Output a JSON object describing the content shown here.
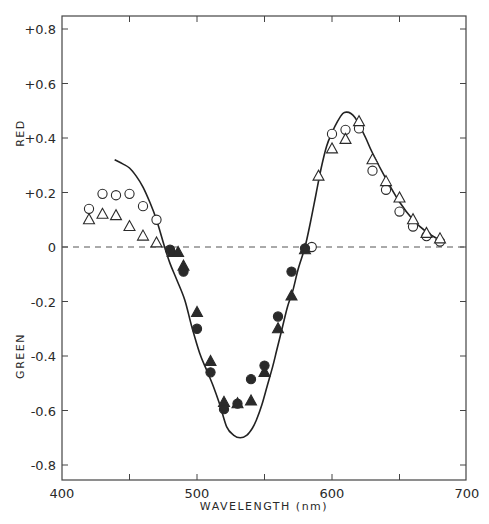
{
  "chart_data": {
    "type": "scatter",
    "title": "",
    "xlabel": "WAVELENGTH (nm)",
    "ylabel_top": "RED",
    "ylabel_bottom": "GREEN",
    "xlim": [
      400,
      700
    ],
    "ylim": [
      -0.85,
      0.85
    ],
    "x_ticks": [
      400,
      450,
      500,
      550,
      600,
      650,
      700
    ],
    "x_tick_labels": [
      "400",
      "500",
      "600",
      "700"
    ],
    "x_tick_label_values": [
      400,
      500,
      600,
      700
    ],
    "y_ticks": [
      0.8,
      0.6,
      0.4,
      0.2,
      0,
      -0.2,
      -0.4,
      -0.6,
      -0.8
    ],
    "y_tick_labels": [
      "+0.8",
      "+0.6",
      "+0.4",
      "+0.2",
      "0",
      "-0.2",
      "-0.4",
      "-0.6",
      "-0.8"
    ],
    "zero_line": "dashed",
    "grid": false,
    "legend": null,
    "series": [
      {
        "name": "theoretical curve",
        "style": "solid-line",
        "x": [
          439,
          445,
          450,
          455,
          460,
          465,
          470,
          476,
          480,
          485,
          491,
          496,
          502,
          507,
          512,
          517,
          522,
          527,
          532,
          537,
          541,
          544,
          548,
          552,
          556,
          559,
          563,
          567,
          571,
          575,
          580,
          584,
          588,
          592,
          596,
          600,
          604,
          608,
          611,
          614,
          617,
          620,
          625,
          630,
          640,
          650,
          660,
          670,
          680
        ],
        "values": [
          0.32,
          0.305,
          0.29,
          0.26,
          0.22,
          0.165,
          0.1,
          0.0,
          -0.06,
          -0.12,
          -0.195,
          -0.29,
          -0.39,
          -0.45,
          -0.51,
          -0.58,
          -0.66,
          -0.69,
          -0.7,
          -0.69,
          -0.665,
          -0.635,
          -0.58,
          -0.51,
          -0.44,
          -0.38,
          -0.3,
          -0.22,
          -0.16,
          -0.08,
          0.0,
          0.09,
          0.19,
          0.29,
          0.37,
          0.42,
          0.46,
          0.49,
          0.495,
          0.49,
          0.475,
          0.45,
          0.4,
          0.345,
          0.25,
          0.165,
          0.1,
          0.055,
          0.025
        ]
      },
      {
        "name": "open circles",
        "marker": "open-circle",
        "x": [
          420,
          430,
          440,
          450,
          460,
          470,
          585,
          600,
          610,
          620,
          630,
          640,
          650,
          660,
          670,
          680
        ],
        "values": [
          0.14,
          0.195,
          0.19,
          0.195,
          0.15,
          0.1,
          0.0,
          0.415,
          0.43,
          0.435,
          0.28,
          0.21,
          0.13,
          0.075,
          0.04,
          0.02
        ]
      },
      {
        "name": "open triangles",
        "marker": "open-triangle",
        "x": [
          420,
          430,
          440,
          450,
          460,
          470,
          590,
          600,
          610,
          620,
          630,
          640,
          650,
          660,
          670,
          680
        ],
        "values": [
          0.1,
          0.12,
          0.115,
          0.075,
          0.04,
          0.015,
          0.26,
          0.36,
          0.395,
          0.46,
          0.32,
          0.24,
          0.18,
          0.1,
          0.05,
          0.03
        ]
      },
      {
        "name": "filled circles",
        "marker": "filled-circle",
        "x": [
          480,
          490,
          500,
          510,
          520,
          530,
          540,
          550,
          560,
          570,
          580
        ],
        "values": [
          -0.01,
          -0.09,
          -0.3,
          -0.46,
          -0.595,
          -0.575,
          -0.485,
          -0.435,
          -0.255,
          -0.09,
          -0.005
        ]
      },
      {
        "name": "filled triangles",
        "marker": "filled-triangle",
        "x": [
          482,
          486,
          490,
          500,
          510,
          520,
          530,
          540,
          550,
          560,
          570,
          580
        ],
        "values": [
          -0.02,
          -0.02,
          -0.07,
          -0.24,
          -0.42,
          -0.57,
          -0.575,
          -0.565,
          -0.46,
          -0.3,
          -0.18,
          -0.01
        ]
      }
    ],
    "plot_area_px": {
      "left": 62,
      "right": 466,
      "top": 16,
      "bottom": 480
    },
    "colors": {
      "ink": "#2a2a2a",
      "background": "#ffffff"
    }
  }
}
